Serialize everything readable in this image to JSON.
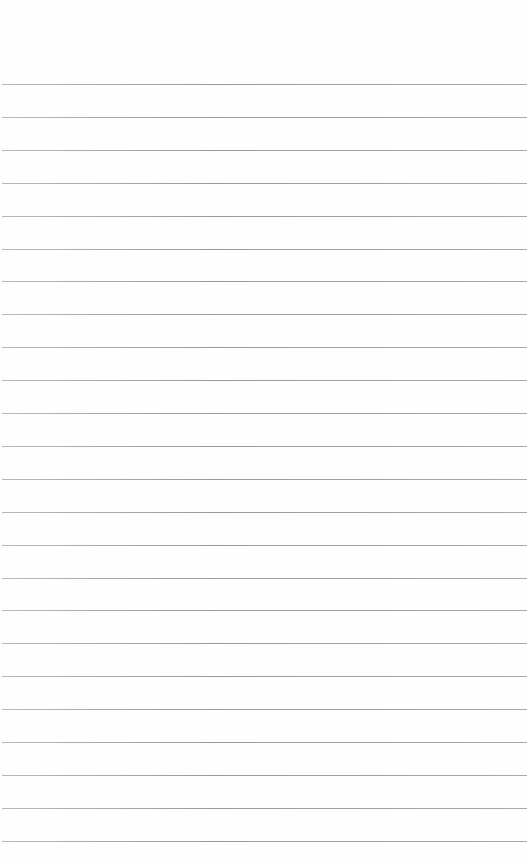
{
  "page": {
    "type": "lined-paper",
    "background_color": "#fefefe",
    "line_color": "#a0a0a0",
    "line_count": 24,
    "first_line_y": 84,
    "line_spacing": 32.9,
    "text": ""
  }
}
